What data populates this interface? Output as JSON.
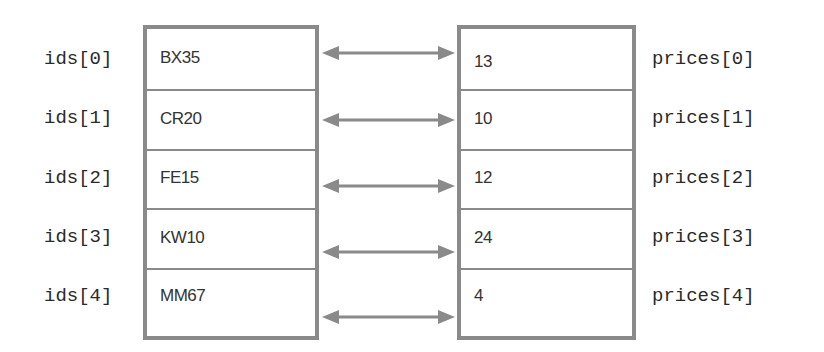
{
  "diagram": {
    "left_array": {
      "name": "ids",
      "labels": [
        "ids[0]",
        "ids[1]",
        "ids[2]",
        "ids[3]",
        "ids[4]"
      ],
      "values": [
        "BX35",
        "CR20",
        "FE15",
        "KW10",
        "MM67"
      ]
    },
    "right_array": {
      "name": "prices",
      "labels": [
        "prices[0]",
        "prices[1]",
        "prices[2]",
        "prices[3]",
        "prices[4]"
      ],
      "values": [
        "13",
        "10",
        "12",
        "24",
        "4"
      ]
    },
    "connectors": {
      "style": "double-headed-arrow",
      "count": 5,
      "color": "#8a8a8a"
    }
  }
}
